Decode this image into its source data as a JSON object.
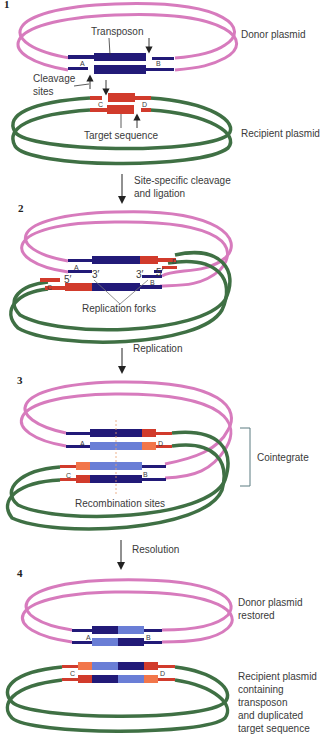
{
  "colors": {
    "donor": "#d77bbd",
    "recipient": "#3f7044",
    "transposon_dark": "#221a78",
    "transposon_light": "#6a7ed6",
    "target_dark": "#d13b2c",
    "target_light": "#f2764a",
    "text": "#3a3a3a",
    "bracket": "#5a7a80"
  },
  "steps": [
    {
      "number": "1",
      "labels": {
        "transposon": "Transposon",
        "donor_plasmid": "Donor plasmid",
        "cleavage_sites": [
          "Cleavage",
          "sites"
        ],
        "target_sequence": "Target sequence",
        "recipient_plasmid": "Recipient plasmid",
        "site_A": "A",
        "site_B": "B",
        "site_C": "C",
        "site_D": "D"
      }
    },
    {
      "number": "2",
      "labels": {
        "site_A": "A",
        "site_B": "B",
        "site_C": "C",
        "site_D": "D",
        "three_prime_left": "3′",
        "three_prime_right": "3′",
        "five_prime_left": "5′",
        "five_prime_right": "5′",
        "replication_forks": "Replication forks"
      }
    },
    {
      "number": "3",
      "labels": {
        "site_A": "A",
        "site_B": "B",
        "site_C": "C",
        "site_D": "D",
        "cointegrate": "Cointegrate",
        "recombination_sites": "Recombination sites"
      }
    },
    {
      "number": "4",
      "labels": {
        "site_A": "A",
        "site_B": "B",
        "site_C": "C",
        "site_D": "D",
        "donor_restored": [
          "Donor plasmid",
          "restored"
        ],
        "recipient_result": [
          "Recipient plasmid",
          "containing",
          "transposon",
          "and duplicated",
          "target sequence"
        ]
      }
    }
  ],
  "transitions": [
    {
      "lines": [
        "Site-specific cleavage",
        "and ligation"
      ]
    },
    {
      "lines": [
        "Replication"
      ]
    },
    {
      "lines": [
        "Resolution"
      ]
    }
  ]
}
